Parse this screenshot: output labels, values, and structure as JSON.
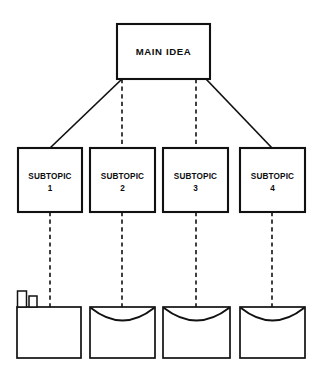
{
  "diagram": {
    "stroke_color": "#111111",
    "background_color": "#ffffff",
    "main_node": {
      "label": "MAIN IDEA",
      "shape": "rectangle"
    },
    "subtopics": [
      {
        "label_line1": "SUBTOPIC",
        "label_line2": "1",
        "shape": "rectangle",
        "link_style": "solid"
      },
      {
        "label_line1": "SUBTOPIC",
        "label_line2": "2",
        "shape": "rectangle",
        "link_style": "dashed"
      },
      {
        "label_line1": "SUBTOPIC",
        "label_line2": "3",
        "shape": "rectangle",
        "link_style": "dashed"
      },
      {
        "label_line1": "SUBTOPIC",
        "label_line2": "4",
        "shape": "rectangle",
        "link_style": "solid"
      }
    ],
    "containers": [
      {
        "shape": "plain-box-with-books",
        "label": "",
        "decoration": "two-book-icons",
        "link_style": "dashed"
      },
      {
        "shape": "envelope-basket",
        "label": "",
        "decoration": "curved-flap",
        "link_style": "dashed"
      },
      {
        "shape": "envelope-basket",
        "label": "",
        "decoration": "curved-flap",
        "link_style": "dashed"
      },
      {
        "shape": "envelope-basket",
        "label": "",
        "decoration": "curved-flap",
        "link_style": "dashed"
      }
    ]
  }
}
